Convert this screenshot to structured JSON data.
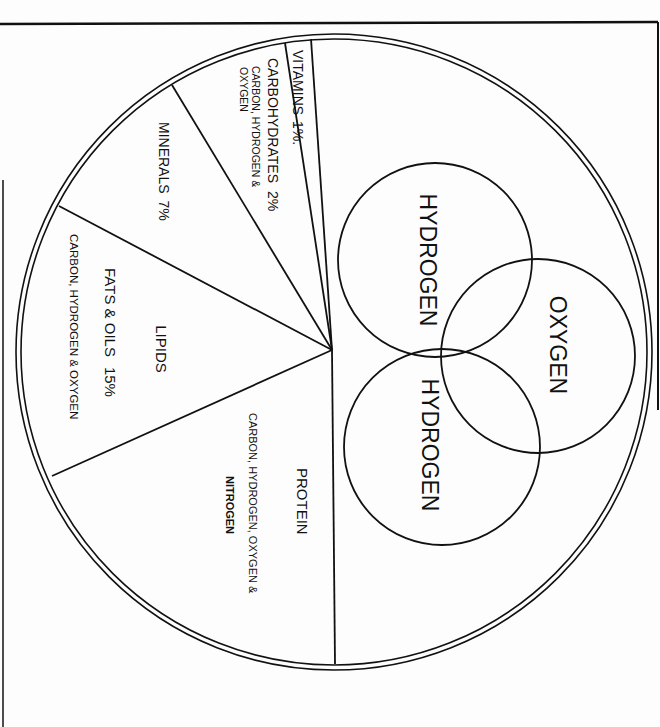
{
  "diagram": {
    "colors": {
      "line": "#111111",
      "background": "#fdfdfd"
    },
    "segments": [
      {
        "id": "vitamins",
        "label": "VITAMINS",
        "percent": "1%.",
        "elements": ""
      },
      {
        "id": "carbohydrates",
        "label": "CARBOHYDRATES",
        "percent": "2%",
        "elements_line1": "CARBON, HYDROGEN &",
        "elements_line2": "OXYGEN"
      },
      {
        "id": "minerals",
        "label": "MINERALS",
        "percent": "7%",
        "elements": ""
      },
      {
        "id": "lipids",
        "label": "LIPIDS",
        "sublabel": "FATS & OILS",
        "percent": "15%",
        "elements": "CARBON, HYDROGEN & OXYGEN"
      },
      {
        "id": "protein",
        "label": "PROTEIN",
        "elements_line1": "CARBON, HYDROGEN, OXYGEN &",
        "elements_line2": "NITROGEN"
      }
    ],
    "water_molecule": {
      "atoms": [
        {
          "id": "hydrogen-top",
          "label": "HYDROGEN"
        },
        {
          "id": "oxygen",
          "label": "OXYGEN"
        },
        {
          "id": "hydrogen-bottom",
          "label": "HYDROGEN"
        }
      ]
    }
  }
}
